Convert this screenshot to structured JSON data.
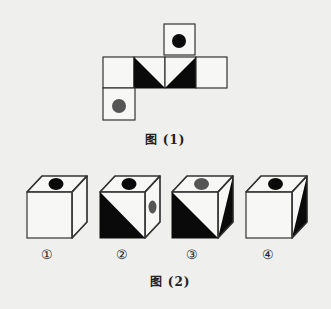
{
  "colors": {
    "background": "#efefed",
    "stroke": "#333333",
    "black": "#0a0a0a",
    "gray_dot": "#555555",
    "face": "#f7f7f5"
  },
  "figure1": {
    "caption": "图 (1)",
    "caption_pos": [
      165,
      138
    ],
    "net": {
      "squares": [
        {
          "id": "top",
          "x": 164,
          "y": 24,
          "size": 31,
          "dot": {
            "cx": 179,
            "cy": 41,
            "r": 7,
            "color": "black"
          }
        },
        {
          "id": "row-1",
          "x": 103,
          "y": 57,
          "size": 31
        },
        {
          "id": "row-2",
          "x": 134,
          "y": 57,
          "size": 31,
          "triangle": [
            [
              134,
              57
            ],
            [
              134,
              88
            ],
            [
              165,
              88
            ]
          ]
        },
        {
          "id": "row-3",
          "x": 165,
          "y": 57,
          "size": 31,
          "triangle": [
            [
              196,
              57
            ],
            [
              196,
              88
            ],
            [
              165,
              88
            ]
          ]
        },
        {
          "id": "row-4",
          "x": 196,
          "y": 57,
          "size": 31
        },
        {
          "id": "bottom",
          "x": 103,
          "y": 88,
          "size": 32,
          "dot": {
            "cx": 119,
            "cy": 106,
            "r": 7,
            "color": "gray"
          }
        }
      ]
    }
  },
  "figure2": {
    "caption": "图 (2)",
    "caption_pos": [
      170,
      280
    ],
    "cubes": [
      {
        "label": "①",
        "label_pos": [
          47,
          254
        ],
        "front": [
          27,
          192,
          45,
          46
        ],
        "depth": [
          15,
          -16
        ],
        "top_dot": {
          "color": "black"
        },
        "front_triangle": false,
        "side_dot": null,
        "side_triangle": false
      },
      {
        "label": "②",
        "label_pos": [
          122,
          254
        ],
        "front": [
          100,
          192,
          45,
          46
        ],
        "depth": [
          15,
          -16
        ],
        "top_dot": {
          "color": "black"
        },
        "front_triangle": true,
        "side_dot": {
          "color": "gray"
        },
        "side_triangle": false
      },
      {
        "label": "③",
        "label_pos": [
          192,
          254
        ],
        "front": [
          172,
          192,
          46,
          46
        ],
        "depth": [
          15,
          -16
        ],
        "top_dot": {
          "color": "gray"
        },
        "front_triangle": true,
        "side_dot": null,
        "side_triangle": true
      },
      {
        "label": "④",
        "label_pos": [
          268,
          254
        ],
        "front": [
          246,
          192,
          46,
          46
        ],
        "depth": [
          15,
          -16
        ],
        "top_dot": {
          "color": "black"
        },
        "front_triangle": false,
        "side_dot": null,
        "side_triangle": true
      }
    ]
  }
}
